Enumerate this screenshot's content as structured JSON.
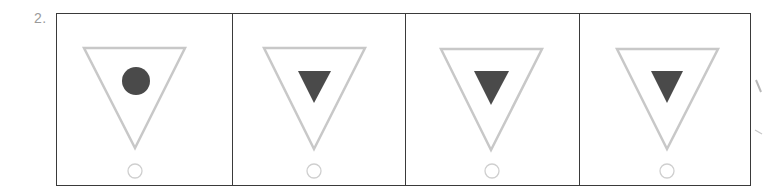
{
  "question": {
    "number_label": "2."
  },
  "colors": {
    "border": "#3a3a3a",
    "outer_triangle_stroke": "#c8c8c8",
    "inner_shape_fill": "#4a4a4a",
    "small_circle_stroke": "#c8c8c8",
    "label": "#9a9a9a"
  },
  "panels": [
    {
      "index": 1,
      "outer_shape": "triangle-down-outline",
      "inner_shape": "circle-filled",
      "bottom_marker": "circle-outline"
    },
    {
      "index": 2,
      "outer_shape": "triangle-down-outline",
      "inner_shape": "triangle-down-filled",
      "bottom_marker": "circle-outline"
    },
    {
      "index": 3,
      "outer_shape": "triangle-down-outline",
      "inner_shape": "triangle-down-filled",
      "bottom_marker": "circle-outline"
    },
    {
      "index": 4,
      "outer_shape": "triangle-down-outline",
      "inner_shape": "triangle-down-filled",
      "bottom_marker": "circle-outline"
    }
  ]
}
